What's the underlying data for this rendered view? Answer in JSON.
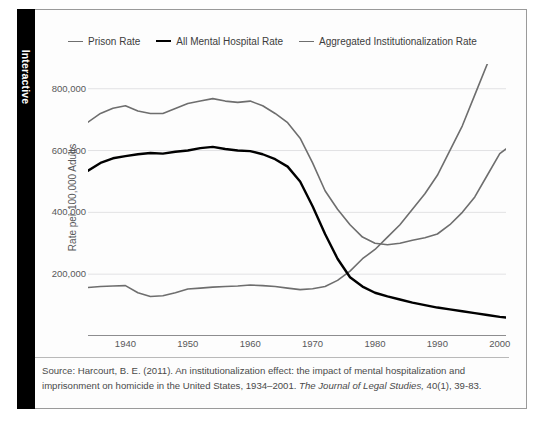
{
  "panel": {
    "tab_label": "Interactive"
  },
  "legend": {
    "position": "top-center",
    "items": [
      {
        "label": "Prison Rate",
        "color": "#6e6e6e",
        "width": 1.6
      },
      {
        "label": "All Mental Hospital Rate",
        "color": "#000000",
        "width": 2.4
      },
      {
        "label": "Aggregated Institutionalization Rate",
        "color": "#6e6e6e",
        "width": 1.6
      }
    ]
  },
  "source": {
    "line1_a": "Source: Harcourt, B. E. (2011). An institutionalization effect: the impact of mental hospitalization and imprisonment",
    "line2_a": "on homicide in the United States, 1934–2001. ",
    "line2_italic": "The Journal of Legal Studies,",
    "line2_b": " 40(1), 39-83."
  },
  "chart_data": {
    "type": "line",
    "title": "",
    "xlabel": "",
    "ylabel": "Rate per 100,000 Adults",
    "xlim": [
      1934,
      2001
    ],
    "ylim": [
      0,
      880000
    ],
    "grid": true,
    "grid_axis": "y",
    "xticks": [
      1940,
      1950,
      1960,
      1970,
      1980,
      1990,
      2000
    ],
    "xtick_labels": [
      "1940",
      "1950",
      "1960",
      "1970",
      "1980",
      "1990",
      "2000"
    ],
    "yticks": [
      200000,
      400000,
      600000,
      800000
    ],
    "ytick_labels": [
      "200,000",
      "400,000",
      "600,000",
      "800,000"
    ],
    "x": [
      1934,
      1936,
      1938,
      1940,
      1942,
      1944,
      1946,
      1948,
      1950,
      1952,
      1954,
      1956,
      1958,
      1960,
      1962,
      1964,
      1966,
      1968,
      1970,
      1972,
      1974,
      1976,
      1978,
      1980,
      1982,
      1984,
      1986,
      1988,
      1990,
      1992,
      1994,
      1996,
      1998,
      2000,
      2001
    ],
    "series": [
      {
        "name": "Prison Rate",
        "color": "#6e6e6e",
        "width": 1.6,
        "values": [
          157000,
          160000,
          162000,
          163000,
          140000,
          128000,
          130000,
          140000,
          152000,
          155000,
          158000,
          160000,
          162000,
          165000,
          163000,
          160000,
          155000,
          150000,
          153000,
          160000,
          180000,
          210000,
          250000,
          280000,
          320000,
          360000,
          410000,
          460000,
          520000,
          600000,
          680000,
          780000,
          880000,
          940000,
          960000
        ],
        "note": "values scaled to plot; rises steeply after 1975, ends just below the aggregated line"
      },
      {
        "name": "All Mental Hospital Rate",
        "color": "#000000",
        "width": 2.4,
        "values": [
          535000,
          560000,
          575000,
          582000,
          588000,
          592000,
          590000,
          596000,
          600000,
          608000,
          612000,
          605000,
          600000,
          598000,
          588000,
          572000,
          548000,
          500000,
          420000,
          330000,
          250000,
          190000,
          160000,
          140000,
          128000,
          118000,
          108000,
          100000,
          92000,
          86000,
          80000,
          74000,
          68000,
          62000,
          60000
        ]
      },
      {
        "name": "Aggregated Institutionalization Rate",
        "color": "#6e6e6e",
        "width": 1.6,
        "values": [
          692000,
          720000,
          737000,
          745000,
          728000,
          720000,
          720000,
          736000,
          752000,
          760000,
          768000,
          760000,
          756000,
          760000,
          745000,
          720000,
          690000,
          640000,
          560000,
          470000,
          410000,
          360000,
          320000,
          300000,
          295000,
          300000,
          310000,
          318000,
          330000,
          360000,
          400000,
          450000,
          520000,
          590000,
          605000
        ]
      }
    ]
  }
}
